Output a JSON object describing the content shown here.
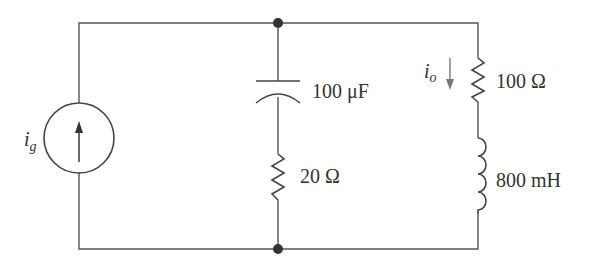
{
  "diagram": {
    "type": "circuit-schematic",
    "colors": {
      "wire": "#555555",
      "text": "#333333",
      "background": "#ffffff"
    },
    "source": {
      "symbol": "i",
      "subscript": "g",
      "kind": "independent current source",
      "direction": "up"
    },
    "capacitor": {
      "value": "100 μF"
    },
    "resistor_middle": {
      "value": "20 Ω"
    },
    "resistor_right": {
      "value": "100 Ω"
    },
    "inductor": {
      "value": "800 mH"
    },
    "output_current": {
      "symbol": "i",
      "subscript": "o",
      "direction": "down"
    },
    "nodes": [
      "top-node",
      "bottom-node"
    ]
  }
}
